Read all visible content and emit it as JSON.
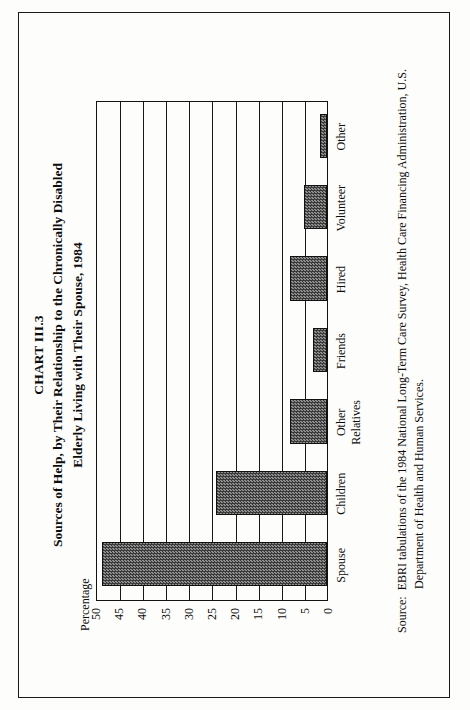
{
  "document": {
    "chart_number": "CHART III.3",
    "title_line_1": "Sources of Help, by Their Relationship to the Chronically Disabled",
    "title_line_2": "Elderly Living with Their Spouse, 1984",
    "source_label": "Source:",
    "source_text": "EBRI tabulations of the 1984 National Long-Term Care Survey, Health Care Financing Administration, U.S. Department of Health and Human Services."
  },
  "chart_data": {
    "type": "bar",
    "title": "Sources of Help, by Their Relationship to the Chronically Disabled Elderly Living with Their Spouse, 1984",
    "subtitle": "CHART III.3",
    "xlabel": "",
    "ylabel": "Percentage",
    "categories": [
      "Spouse",
      "Children",
      "Other\nRelatives",
      "Friends",
      "Hired",
      "Volunteer",
      "Other"
    ],
    "values": [
      48.5,
      24,
      8,
      3,
      8,
      5,
      1.5
    ],
    "ylim": [
      0,
      50
    ],
    "yticks": [
      50,
      45,
      40,
      35,
      30,
      25,
      20,
      15,
      10,
      5,
      0
    ],
    "ytick_labels": [
      "50",
      "45",
      "40",
      "35",
      "30",
      "25",
      "20",
      "15",
      "10",
      "5",
      "0"
    ],
    "grid": true,
    "grid_axis": "y",
    "legend": false,
    "bar_fill": "#5a5a5a",
    "bar_edge": "#111111",
    "orientation": "vertical",
    "page_background": "#fdfdfb",
    "ink_color": "#0d0d0d"
  }
}
